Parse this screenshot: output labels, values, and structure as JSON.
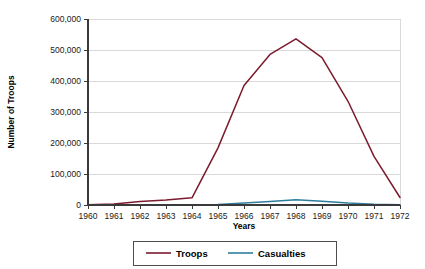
{
  "chart_data": {
    "type": "line",
    "title": "",
    "xlabel": "Years",
    "ylabel": "Number of Troops",
    "x": [
      1960,
      1961,
      1962,
      1963,
      1964,
      1965,
      1966,
      1967,
      1968,
      1969,
      1970,
      1971,
      1972
    ],
    "categories": [
      "1960",
      "1961",
      "1962",
      "1963",
      "1964",
      "1965",
      "1966",
      "1967",
      "1968",
      "1969",
      "1970",
      "1971",
      "1972"
    ],
    "series": [
      {
        "name": "Troops",
        "color": "#7B1B2E",
        "values": [
          900,
          3200,
          11300,
          16300,
          23300,
          184300,
          385300,
          485600,
          536100,
          475200,
          334600,
          156800,
          24200
        ]
      },
      {
        "name": "Casualties",
        "color": "#2E7D9E",
        "values": [
          0,
          0,
          0,
          0,
          0,
          1900,
          6350,
          11360,
          16899,
          11780,
          6173,
          2414,
          759
        ]
      }
    ],
    "ylim": [
      0,
      600000
    ],
    "xlim": [
      1960,
      1972
    ],
    "yticks": [
      0,
      100000,
      200000,
      300000,
      400000,
      500000,
      600000
    ],
    "ytick_labels": [
      "0",
      "100,000",
      "200,000",
      "300,000",
      "400,000",
      "500,000",
      "600,000"
    ],
    "grid": "horizontal",
    "legend_position": "bottom-center",
    "legend_entries": [
      "Troops",
      "Casualties"
    ]
  },
  "legend": {
    "items": [
      {
        "label": "Troops",
        "color": "#7B1B2E"
      },
      {
        "label": "Casualties",
        "color": "#2E7D9E"
      }
    ]
  },
  "axes": {
    "y_title": "Number of Troops",
    "x_title": "Years",
    "y_ticks": [
      "600,000",
      "500,000",
      "400,000",
      "300,000",
      "200,000",
      "100,000",
      "0"
    ],
    "x_ticks": [
      "1960",
      "1961",
      "1962",
      "1963",
      "1964",
      "1965",
      "1966",
      "1967",
      "1968",
      "1969",
      "1970",
      "1971",
      "1972"
    ]
  }
}
